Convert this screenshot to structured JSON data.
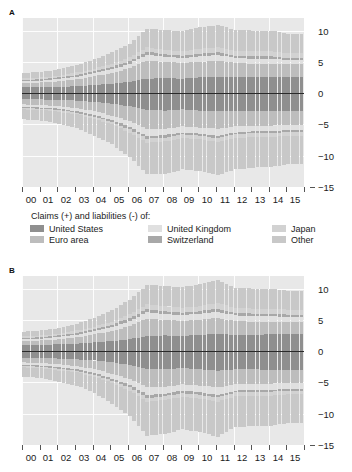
{
  "panels": [
    {
      "letter": "A",
      "name": "panel-a"
    },
    {
      "letter": "B",
      "name": "panel-b"
    }
  ],
  "legend": {
    "title": "Claims (+) and liabilities (-) of:",
    "items": [
      {
        "label": "United States",
        "color": "#8f8f8f"
      },
      {
        "label": "United Kingdom",
        "color": "#e0e0e0"
      },
      {
        "label": "Japan",
        "color": "#d2d2d2"
      },
      {
        "label": "Euro area",
        "color": "#bdbdbd"
      },
      {
        "label": "Switzerland",
        "color": "#a8a8a8"
      },
      {
        "label": "Other",
        "color": "#c8c8c8"
      }
    ]
  },
  "axes": {
    "y_ticks": [
      10,
      5,
      0,
      -5,
      -10,
      -15
    ],
    "y_tick_labels": [
      "10",
      "5",
      "0",
      "−5",
      "−10",
      "−15"
    ],
    "ylim": [
      -15,
      12
    ],
    "x_tick_labels": [
      "00",
      "01",
      "02",
      "03",
      "04",
      "05",
      "06",
      "07",
      "08",
      "09",
      "10",
      "11",
      "12",
      "13",
      "14",
      "15"
    ]
  },
  "chart_data": {
    "type": "bar",
    "title": "",
    "subtitle": "",
    "xlabel": "",
    "ylabel": "",
    "ylim": [
      -15,
      12
    ],
    "grid": true,
    "legend_position": "below",
    "stacked": true,
    "note": "Two stacked bar panels (A and B). Quarterly observations 2000-2015. Positive stack = claims, negative stack = liabilities. Values in USD trillions.",
    "categories": [
      "00",
      "01",
      "02",
      "03",
      "04",
      "05",
      "06",
      "07",
      "08",
      "09",
      "10",
      "11",
      "12",
      "13",
      "14",
      "15"
    ],
    "panels": [
      {
        "letter": "A",
        "series_positive": [
          {
            "name": "United States",
            "color": "#8f8f8f",
            "values": [
              0.9,
              0.9,
              1.0,
              1.1,
              1.3,
              1.5,
              1.8,
              2.3,
              2.4,
              2.3,
              2.5,
              2.6,
              2.5,
              2.5,
              2.6,
              2.6
            ]
          },
          {
            "name": "Euro area",
            "color": "#bdbdbd",
            "values": [
              0.7,
              0.8,
              0.9,
              1.1,
              1.4,
              1.7,
              2.2,
              2.9,
              2.6,
              2.5,
              2.5,
              2.6,
              2.3,
              2.2,
              2.1,
              2.0
            ]
          },
          {
            "name": "United Kingdom",
            "color": "#e0e0e0",
            "values": [
              0.3,
              0.3,
              0.4,
              0.4,
              0.5,
              0.6,
              0.7,
              0.9,
              0.8,
              0.8,
              0.9,
              0.9,
              0.8,
              0.8,
              0.8,
              0.7
            ]
          },
          {
            "name": "Switzerland",
            "color": "#a8a8a8",
            "values": [
              0.2,
              0.2,
              0.2,
              0.3,
              0.3,
              0.4,
              0.4,
              0.5,
              0.4,
              0.4,
              0.4,
              0.4,
              0.4,
              0.4,
              0.4,
              0.3
            ]
          },
          {
            "name": "Japan",
            "color": "#d2d2d2",
            "values": [
              0.3,
              0.3,
              0.3,
              0.4,
              0.4,
              0.5,
              0.6,
              0.7,
              0.7,
              0.7,
              0.8,
              0.8,
              0.8,
              0.8,
              0.8,
              0.8
            ]
          },
          {
            "name": "Other",
            "color": "#c8c8c8",
            "values": [
              0.8,
              0.9,
              1.0,
              1.2,
              1.5,
              1.8,
              2.2,
              3.0,
              3.2,
              3.2,
              3.4,
              3.6,
              3.3,
              3.3,
              3.3,
              3.1
            ]
          }
        ],
        "series_negative": [
          {
            "name": "United States",
            "color": "#8f8f8f",
            "values": [
              -1.0,
              -1.0,
              -1.1,
              -1.2,
              -1.4,
              -1.7,
              -2.1,
              -2.7,
              -2.8,
              -2.6,
              -2.8,
              -2.9,
              -2.8,
              -2.8,
              -2.9,
              -2.9
            ]
          },
          {
            "name": "Euro area",
            "color": "#bdbdbd",
            "values": [
              -0.8,
              -0.9,
              -1.0,
              -1.2,
              -1.5,
              -1.9,
              -2.4,
              -3.1,
              -2.9,
              -2.7,
              -2.7,
              -2.8,
              -2.5,
              -2.4,
              -2.3,
              -2.2
            ]
          },
          {
            "name": "United Kingdom",
            "color": "#e0e0e0",
            "values": [
              -0.4,
              -0.4,
              -0.4,
              -0.5,
              -0.6,
              -0.7,
              -0.9,
              -1.1,
              -1.0,
              -1.0,
              -1.0,
              -1.1,
              -1.0,
              -0.9,
              -0.9,
              -0.8
            ]
          },
          {
            "name": "Switzerland",
            "color": "#a8a8a8",
            "values": [
              -0.2,
              -0.2,
              -0.2,
              -0.2,
              -0.3,
              -0.3,
              -0.4,
              -0.4,
              -0.4,
              -0.3,
              -0.3,
              -0.4,
              -0.3,
              -0.3,
              -0.3,
              -0.3
            ]
          },
          {
            "name": "Japan",
            "color": "#d2d2d2",
            "values": [
              -0.2,
              -0.2,
              -0.3,
              -0.3,
              -0.3,
              -0.4,
              -0.5,
              -0.6,
              -0.6,
              -0.6,
              -0.6,
              -0.6,
              -0.6,
              -0.6,
              -0.6,
              -0.6
            ]
          },
          {
            "name": "Other",
            "color": "#c8c8c8",
            "values": [
              -1.6,
              -1.7,
              -1.9,
              -2.2,
              -2.7,
              -3.2,
              -3.9,
              -5.1,
              -5.2,
              -5.0,
              -5.1,
              -5.3,
              -5.0,
              -4.9,
              -4.8,
              -4.6
            ]
          }
        ]
      },
      {
        "letter": "B",
        "series_positive": [
          {
            "name": "United States",
            "color": "#8f8f8f",
            "values": [
              1.0,
              1.0,
              1.1,
              1.2,
              1.4,
              1.6,
              1.9,
              2.4,
              2.5,
              2.4,
              2.6,
              2.8,
              2.6,
              2.6,
              2.7,
              2.7
            ]
          },
          {
            "name": "Euro area",
            "color": "#bdbdbd",
            "values": [
              0.6,
              0.7,
              0.8,
              1.0,
              1.3,
              1.6,
              2.1,
              2.8,
              2.5,
              2.4,
              2.4,
              2.5,
              2.2,
              2.1,
              2.0,
              1.9
            ]
          },
          {
            "name": "United Kingdom",
            "color": "#e0e0e0",
            "values": [
              0.3,
              0.3,
              0.4,
              0.4,
              0.5,
              0.6,
              0.8,
              1.0,
              0.9,
              0.9,
              1.0,
              1.0,
              0.9,
              0.9,
              0.9,
              0.8
            ]
          },
          {
            "name": "Switzerland",
            "color": "#a8a8a8",
            "values": [
              0.2,
              0.2,
              0.2,
              0.3,
              0.3,
              0.4,
              0.5,
              0.5,
              0.5,
              0.4,
              0.4,
              0.5,
              0.4,
              0.4,
              0.4,
              0.4
            ]
          },
          {
            "name": "Japan",
            "color": "#d2d2d2",
            "values": [
              0.3,
              0.3,
              0.3,
              0.4,
              0.4,
              0.5,
              0.6,
              0.8,
              0.8,
              0.8,
              0.8,
              0.9,
              0.8,
              0.8,
              0.8,
              0.8
            ]
          },
          {
            "name": "Other",
            "color": "#c8c8c8",
            "values": [
              0.7,
              0.8,
              0.9,
              1.1,
              1.4,
              1.8,
              2.3,
              3.1,
              3.2,
              3.3,
              3.5,
              3.7,
              3.2,
              3.2,
              3.2,
              3.0
            ]
          }
        ],
        "series_negative": [
          {
            "name": "United States",
            "color": "#8f8f8f",
            "values": [
              -1.1,
              -1.1,
              -1.2,
              -1.3,
              -1.5,
              -1.8,
              -2.2,
              -2.8,
              -2.9,
              -2.7,
              -2.9,
              -3.1,
              -2.9,
              -2.9,
              -3.0,
              -3.0
            ]
          },
          {
            "name": "Euro area",
            "color": "#bdbdbd",
            "values": [
              -0.7,
              -0.8,
              -0.9,
              -1.1,
              -1.4,
              -1.8,
              -2.3,
              -3.0,
              -2.8,
              -2.6,
              -2.6,
              -2.7,
              -2.4,
              -2.3,
              -2.2,
              -2.1
            ]
          },
          {
            "name": "United Kingdom",
            "color": "#e0e0e0",
            "values": [
              -0.4,
              -0.4,
              -0.5,
              -0.5,
              -0.6,
              -0.8,
              -0.9,
              -1.2,
              -1.1,
              -1.0,
              -1.1,
              -1.2,
              -1.0,
              -1.0,
              -1.0,
              -0.9
            ]
          },
          {
            "name": "Switzerland",
            "color": "#a8a8a8",
            "values": [
              -0.2,
              -0.2,
              -0.2,
              -0.2,
              -0.3,
              -0.3,
              -0.4,
              -0.5,
              -0.4,
              -0.4,
              -0.4,
              -0.4,
              -0.3,
              -0.3,
              -0.3,
              -0.3
            ]
          },
          {
            "name": "Japan",
            "color": "#d2d2d2",
            "values": [
              -0.2,
              -0.2,
              -0.3,
              -0.3,
              -0.3,
              -0.4,
              -0.5,
              -0.6,
              -0.6,
              -0.6,
              -0.6,
              -0.7,
              -0.6,
              -0.6,
              -0.6,
              -0.6
            ]
          },
          {
            "name": "Other",
            "color": "#c8c8c8",
            "values": [
              -1.5,
              -1.6,
              -1.8,
              -2.1,
              -2.6,
              -3.3,
              -4.1,
              -5.4,
              -5.4,
              -5.2,
              -5.3,
              -5.6,
              -4.9,
              -4.9,
              -4.8,
              -4.6
            ]
          }
        ]
      }
    ]
  }
}
